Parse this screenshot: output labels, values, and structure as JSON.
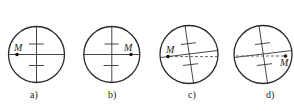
{
  "figure": {
    "panels": [
      {
        "id": "a",
        "caption": "a)",
        "point_label": "M",
        "point_position": "left",
        "reticle": "level",
        "dashed_reference": false
      },
      {
        "id": "b",
        "caption": "b)",
        "point_label": "M",
        "point_position": "right",
        "reticle": "level",
        "dashed_reference": false
      },
      {
        "id": "c",
        "caption": "c)",
        "point_label": "M",
        "point_position": "left",
        "reticle": "tilted",
        "dashed_reference": true
      },
      {
        "id": "d",
        "caption": "d)",
        "point_label": "M",
        "point_position": "right",
        "reticle": "tilted",
        "dashed_reference": true
      }
    ],
    "colors": {
      "stroke": "#2a2a2a",
      "background": "#ffffff"
    }
  }
}
